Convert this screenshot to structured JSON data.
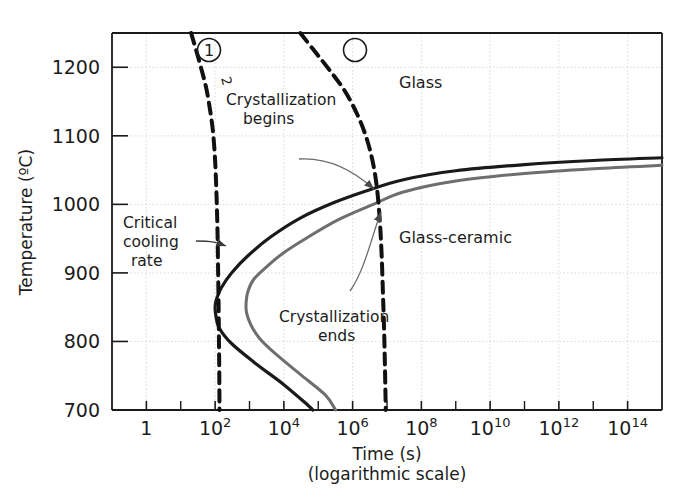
{
  "chart_data": {
    "type": "line",
    "title": "",
    "xlabel": "Time (s)",
    "xlabel_sub": "(logarithmic scale)",
    "ylabel": "Temperature (ºC)",
    "xscale": "log",
    "xlim": [
      0.1,
      1000000000000000.0
    ],
    "ylim": [
      700,
      1250
    ],
    "grid": true,
    "x_tick_labels": [
      {
        "base": "1",
        "exp": ""
      },
      {
        "base": "10",
        "exp": "2"
      },
      {
        "base": "10",
        "exp": "4"
      },
      {
        "base": "10",
        "exp": "6"
      },
      {
        "base": "10",
        "exp": "8"
      },
      {
        "base": "10",
        "exp": "10"
      },
      {
        "base": "10",
        "exp": "12"
      },
      {
        "base": "10",
        "exp": "14"
      }
    ],
    "x_tick_values": [
      1,
      100,
      10000,
      1000000,
      100000000,
      10000000000,
      1000000000000,
      100000000000000
    ],
    "y_tick_labels": [
      "1200",
      "1100",
      "1000",
      "900",
      "800",
      "700"
    ],
    "y_tick_values": [
      1200,
      1100,
      1000,
      900,
      800,
      700
    ],
    "series": [
      {
        "name": "Crystallization begins",
        "role": "ttt-start",
        "color": "#1a1a1a",
        "style": "solid",
        "width": 3.2,
        "points": [
          [
            1000000000000000.0,
            1068
          ],
          [
            10000000000000.0,
            1064
          ],
          [
            100000000000.0,
            1058
          ],
          [
            1000000000.0,
            1049
          ],
          [
            30000000.0,
            1036
          ],
          [
            3000000.0,
            1021
          ],
          [
            300000.0,
            1003
          ],
          [
            30000.0,
            980
          ],
          [
            4000,
            952
          ],
          [
            900,
            925
          ],
          [
            300,
            900
          ],
          [
            150,
            878
          ],
          [
            110,
            862
          ],
          [
            100,
            851
          ],
          [
            105,
            838
          ],
          [
            130,
            820
          ],
          [
            300,
            797
          ],
          [
            1500,
            768
          ],
          [
            10000.0,
            737
          ],
          [
            50000.0,
            707
          ],
          [
            70000.0,
            700
          ]
        ]
      },
      {
        "name": "Crystallization ends",
        "role": "ttt-end",
        "color": "#6e6e6e",
        "style": "solid",
        "width": 3.0,
        "points": [
          [
            1000000000000000.0,
            1057
          ],
          [
            10000000000000.0,
            1052
          ],
          [
            100000000000.0,
            1045
          ],
          [
            1000000000.0,
            1034
          ],
          [
            30000000.0,
            1018
          ],
          [
            4000000.0,
            1000
          ],
          [
            400000.0,
            978
          ],
          [
            50000.0,
            952
          ],
          [
            9000,
            928
          ],
          [
            3000,
            908
          ],
          [
            1300,
            890
          ],
          [
            900,
            873
          ],
          [
            800,
            858
          ],
          [
            820,
            842
          ],
          [
            1100,
            824
          ],
          [
            2000,
            804
          ],
          [
            6000,
            781
          ],
          [
            30000.0,
            752
          ],
          [
            160000.0,
            722
          ],
          [
            320000.0,
            700
          ]
        ]
      },
      {
        "name": "Cooling curve 2 (100ºC/min)",
        "role": "cooling-fast",
        "color": "#111111",
        "style": "dashed",
        "width": 4.0,
        "points": [
          [
            20,
            1250
          ],
          [
            28,
            1225
          ],
          [
            40,
            1197
          ],
          [
            55,
            1170
          ],
          [
            70,
            1140
          ],
          [
            85,
            1110
          ],
          [
            97,
            1075
          ],
          [
            105,
            1040
          ],
          [
            112,
            1000
          ],
          [
            118,
            955
          ],
          [
            122,
            905
          ],
          [
            126,
            855
          ],
          [
            129,
            805
          ],
          [
            132,
            755
          ],
          [
            134,
            700
          ]
        ]
      },
      {
        "name": "Cooling curve 1",
        "role": "cooling-slow",
        "color": "#111111",
        "style": "dashed",
        "width": 4.0,
        "points": [
          [
            30000.0,
            1250
          ],
          [
            80000.0,
            1223
          ],
          [
            220000.0,
            1195
          ],
          [
            600000.0,
            1165
          ],
          [
            1400000.0,
            1130
          ],
          [
            2600000.0,
            1095
          ],
          [
            4000000.0,
            1058
          ],
          [
            5200000.0,
            1020
          ],
          [
            6200000.0,
            975
          ],
          [
            7000000.0,
            925
          ],
          [
            7600000.0,
            872
          ],
          [
            8200000.0,
            820
          ],
          [
            8700000.0,
            765
          ],
          [
            9200000.0,
            700
          ]
        ]
      }
    ],
    "annotations": [
      {
        "id": "glass",
        "text": "Glass",
        "x": 100000000.0,
        "y": 1110
      },
      {
        "id": "glass-ceramic",
        "text": "Glass-ceramic",
        "x": 100000000.0,
        "y": 940
      },
      {
        "id": "crystallization-begins-l1",
        "text": "Crystallization",
        "x": 3000.0,
        "y": 1108
      },
      {
        "id": "crystallization-begins-l2",
        "text": "begins",
        "x": 3000.0,
        "y": 1080
      },
      {
        "id": "crystallization-ends-l1",
        "text": "Crystallization",
        "x": 120000.0,
        "y": 872
      },
      {
        "id": "crystallization-ends-l2",
        "text": "ends",
        "x": 120000.0,
        "y": 845
      },
      {
        "id": "critical-cooling-l1",
        "text": "Critical",
        "x": 2.0,
        "y": 970
      },
      {
        "id": "critical-cooling-l2",
        "text": "cooling",
        "x": 2.0,
        "y": 943
      },
      {
        "id": "critical-cooling-l3",
        "text": "rate",
        "x": 2.0,
        "y": 916
      },
      {
        "id": "rate-label",
        "text": "100ºC/min",
        "x": 170,
        "y": 1150
      },
      {
        "id": "curve-number-2",
        "text": "2",
        "x": 200,
        "y": 1222
      },
      {
        "id": "curve-number-1",
        "text": "1",
        "x": 360000.0,
        "y": 1222
      }
    ]
  }
}
